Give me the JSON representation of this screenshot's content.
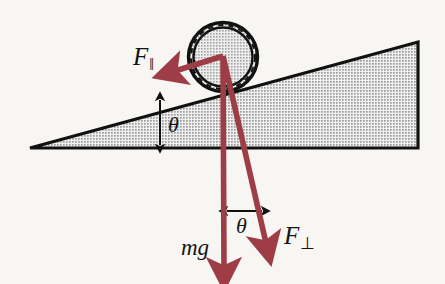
{
  "figure": {
    "background_color": "#f7f6f2",
    "labels": {
      "force_parallel": {
        "symbol": "F",
        "subscript": "‖",
        "name": "force-parallel"
      },
      "force_perpendicular": {
        "symbol": "F",
        "subscript": "⊥",
        "name": "force-perpendicular"
      },
      "weight": {
        "text": "mg",
        "name": "weight"
      },
      "theta_incline": {
        "text": "θ",
        "name": "incline-angle"
      },
      "theta_force": {
        "text": "θ",
        "name": "force-angle"
      }
    },
    "colors": {
      "vector": "#9e3d45",
      "vector_dark": "#8b3038",
      "outline": "#111111",
      "incline_fill": "#c2c2c2",
      "wheel_fill": "#c2c2c2"
    },
    "geometry": {
      "incline": {
        "apex_left": [
          30,
          148
        ],
        "top_right": [
          418,
          42
        ],
        "bottom_right": [
          418,
          148
        ],
        "angle_degrees": 15
      },
      "wheel": {
        "center": [
          223,
          57
        ],
        "radius_outer": 35,
        "radius_inner": 30
      },
      "vector_origin": [
        223,
        56
      ],
      "vectors": [
        {
          "name": "force-parallel",
          "tip": [
            166,
            73
          ]
        },
        {
          "name": "weight",
          "tip": [
            224,
            276
          ]
        },
        {
          "name": "force-perpendicular",
          "tip": [
            270,
            252
          ]
        }
      ],
      "angle_markers": [
        {
          "name": "incline-angle-marker",
          "from": [
            160,
            100
          ],
          "to": [
            160,
            145
          ]
        },
        {
          "name": "force-angle-marker",
          "from": [
            226,
            211
          ],
          "to": [
            262,
            211
          ]
        }
      ]
    }
  }
}
